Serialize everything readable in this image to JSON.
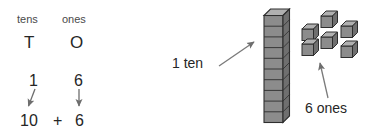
{
  "figure": {
    "background_color": "#ffffff",
    "text_color": "#262626",
    "arrow_color": "#6e6e6e",
    "block_face_color": "#8c8c8c",
    "block_top_color": "#a8a8a8",
    "block_side_color": "#6f6f6f",
    "block_outline_color": "#2e2e2e"
  },
  "place_value_table": {
    "headers": {
      "tens": "tens",
      "ones": "ones"
    },
    "abbreviations": {
      "tens": "T",
      "ones": "O"
    },
    "digits": {
      "tens": "1",
      "ones": "6"
    },
    "expanded": {
      "tens_value": "10",
      "operator": "+",
      "ones_value": "6"
    }
  },
  "base_ten_blocks": {
    "rod": {
      "label": "1 ten",
      "unit_count": 10,
      "value": 10
    },
    "units": {
      "label": "6 ones",
      "unit_count": 6,
      "value": 6
    }
  },
  "icons": {
    "tens_arrow": "arrow-down-icon",
    "ones_arrow": "arrow-down-icon",
    "rod_pointer": "arrow-up-right-icon",
    "units_pointer": "arrow-up-icon"
  }
}
